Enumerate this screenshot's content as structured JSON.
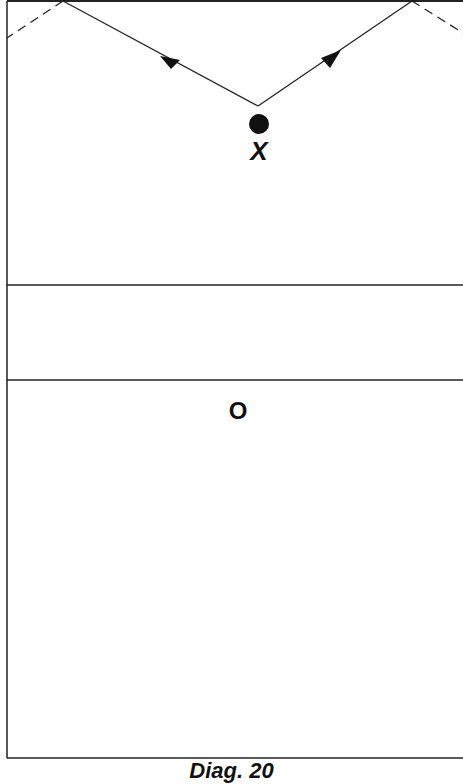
{
  "diagram": {
    "caption": "Diag. 20",
    "players": {
      "x_label": "X",
      "o_label": "O"
    },
    "colors": {
      "line": "#222222",
      "background": "#ffffff"
    },
    "elements": {
      "court_lines": 2,
      "path_description": "Two solid arrowed paths from point above X diverging up-left and up-right to top boundary, continuing as dashed reflection lines"
    }
  }
}
